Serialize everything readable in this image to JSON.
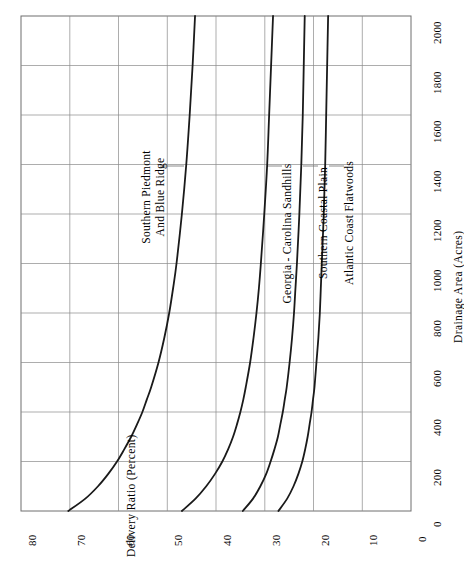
{
  "chart_data": {
    "type": "line",
    "title": "",
    "orientation": "rotated-90-ccw",
    "xlabel": "Drainage Area (Acres)",
    "ylabel": "Delivery Ratio (Percent)",
    "xlim": [
      0,
      2000
    ],
    "ylim": [
      0,
      80
    ],
    "xticks": [
      0,
      200,
      400,
      600,
      800,
      1000,
      1200,
      1400,
      1600,
      1800,
      2000
    ],
    "xtick_labels": [
      "0",
      "200",
      "400",
      "600",
      "800",
      "1000",
      "1200",
      "1400",
      "1600",
      "1800",
      "2000"
    ],
    "yticks": [
      0,
      10,
      20,
      30,
      40,
      50,
      60,
      70,
      80
    ],
    "ytick_labels": [
      "0",
      "10",
      "20",
      "30",
      "40",
      "50",
      "60",
      "70",
      "80"
    ],
    "grid": true,
    "legend_position": "inline-annotations",
    "x": [
      0,
      50,
      100,
      150,
      200,
      250,
      300,
      350,
      400,
      450,
      500,
      600,
      700,
      800,
      900,
      1000,
      1200,
      1400,
      1600,
      1800,
      2000
    ],
    "series": [
      {
        "name": "Southern Piedmont And Blue Ridge",
        "color": "#1a1a1a",
        "values": [
          70.3,
          66.8,
          64.2,
          62.1,
          60.3,
          58.8,
          57.4,
          56.2,
          55.1,
          54.2,
          53.3,
          51.8,
          50.6,
          49.6,
          48.8,
          48.1,
          47.0,
          46.1,
          45.4,
          44.8,
          44.3
        ]
      },
      {
        "name": "Georgia - Carolina Sandhills",
        "color": "#1a1a1a",
        "values": [
          47.0,
          44.2,
          42.0,
          40.2,
          38.7,
          37.5,
          36.5,
          35.7,
          35.0,
          34.4,
          33.9,
          33.0,
          32.3,
          31.7,
          31.2,
          30.8,
          30.1,
          29.5,
          29.1,
          28.7,
          28.3
        ]
      },
      {
        "name": "Southern Coastal Plain",
        "color": "#1a1a1a",
        "values": [
          34.5,
          32.4,
          30.9,
          29.7,
          28.8,
          28.0,
          27.3,
          26.8,
          26.3,
          25.9,
          25.5,
          24.9,
          24.4,
          24.0,
          23.7,
          23.4,
          22.9,
          22.5,
          22.2,
          22.0,
          21.8
        ]
      },
      {
        "name": "Atlantic Coast Flatwoods",
        "color": "#1a1a1a",
        "values": [
          27.2,
          25.4,
          24.1,
          23.1,
          22.3,
          21.7,
          21.2,
          20.8,
          20.4,
          20.1,
          19.8,
          19.4,
          19.0,
          18.7,
          18.5,
          18.3,
          17.9,
          17.6,
          17.4,
          17.2,
          17.0
        ]
      }
    ],
    "annotations": [
      {
        "text_lines": [
          "Southern Piedmont",
          "And Blue Ridge"
        ],
        "series": "Southern Piedmont And Blue Ridge"
      },
      {
        "text_lines": [
          "Georgia - Carolina Sandhills"
        ],
        "series": "Georgia - Carolina Sandhills"
      },
      {
        "text_lines": [
          "Southern Coastal Plain"
        ],
        "series": "Southern Coastal Plain"
      },
      {
        "text_lines": [
          "Atlantic Coast Flatwoods"
        ],
        "series": "Atlantic Coast Flatwoods"
      }
    ]
  },
  "axes": {
    "x_title": "Drainage Area (Acres)",
    "y_title": "Delivery Ratio (Percent)",
    "x_ticks": [
      "0",
      "200",
      "400",
      "600",
      "800",
      "1000",
      "1200",
      "1400",
      "1600",
      "1800",
      "2000"
    ],
    "y_ticks": [
      "80",
      "70",
      "60",
      "50",
      "40",
      "30",
      "20",
      "10",
      "0"
    ]
  },
  "labels": {
    "s1_line1": "Southern Piedmont",
    "s1_line2": "And Blue Ridge",
    "s2": "Georgia - Carolina Sandhills",
    "s3": "Southern Coastal Plain",
    "s4": "Atlantic Coast Flatwoods"
  },
  "colors": {
    "curve": "#1a1a1a",
    "grid": "#8a8a8a",
    "frame": "#6e6e6e",
    "background": "#ffffff"
  }
}
